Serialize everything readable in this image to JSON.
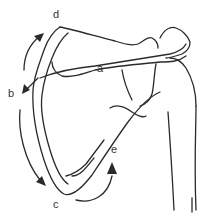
{
  "figure": {
    "line_color": "#2a2a2a",
    "background": "#ffffff",
    "labels": [
      {
        "id": "a",
        "text": "a",
        "x": 97,
        "y": 63
      },
      {
        "id": "b",
        "text": "b",
        "x": 8,
        "y": 88
      },
      {
        "id": "c",
        "text": "c",
        "x": 53,
        "y": 199
      },
      {
        "id": "d",
        "text": "d",
        "x": 53,
        "y": 9
      },
      {
        "id": "e",
        "text": "e",
        "x": 111,
        "y": 144
      }
    ],
    "arrows": [
      {
        "id": "arrow-d",
        "description": "curved arrow along superior-medial border pointing up toward superior angle"
      },
      {
        "id": "arrow-b",
        "description": "arrow near spine root pointing down-left"
      },
      {
        "id": "arrow-c",
        "description": "curved arrow along medial border pointing down toward inferior angle"
      },
      {
        "id": "arrow-e",
        "description": "curved arrow near lateral border pointing up"
      }
    ]
  }
}
